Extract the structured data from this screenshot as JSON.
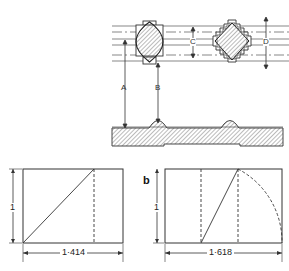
{
  "figure": {
    "top_diagram": {
      "labels": {
        "A": "A",
        "B": "B",
        "C": "C",
        "D": "D"
      },
      "description": "Elevation of profiled bars with cross sections; baseline hatched section"
    },
    "rect_root2": {
      "height_label": "1",
      "width_label": "1·414"
    },
    "rect_golden": {
      "panel_label": "b",
      "height_label": "1",
      "width_label": "1·618"
    }
  },
  "colors": {
    "ink": "#333333",
    "hatch": "#555555",
    "background": "#ffffff"
  }
}
